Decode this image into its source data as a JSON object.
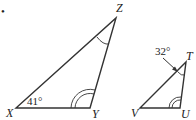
{
  "figure": {
    "bullet": "•",
    "triangle_xyz": {
      "vertices": {
        "X": "X",
        "Y": "Y",
        "Z": "Z"
      },
      "angle_x_label": "41°",
      "angle_y_mark": "double-arc",
      "angle_z_mark": "single-arc"
    },
    "triangle_vut": {
      "vertices": {
        "V": "V",
        "U": "U",
        "T": "T"
      },
      "angle_t_label": "32°",
      "angle_u_mark": "double-arc",
      "angle_t_mark": "single-arc-with-arrow"
    },
    "colors": {
      "stroke": "#333333",
      "text": "#222222",
      "background": "#ffffff"
    }
  }
}
